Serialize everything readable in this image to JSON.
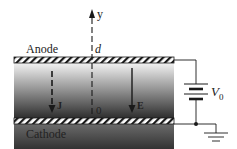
{
  "diagram": {
    "labels": {
      "anode": "Anode",
      "cathode": "Cathode",
      "y_axis": "y",
      "d": "d",
      "origin": "0",
      "current_density": "J",
      "electric_field": "E",
      "voltage_source": "V",
      "voltage_subscript": "0"
    },
    "colors": {
      "region_top": "#f2f2f2",
      "region_bottom": "#2e2e2e",
      "line": "#1a1a1a"
    },
    "components": [
      "anode-plate",
      "cathode-plate",
      "y-axis",
      "current-density-arrow",
      "electric-field-arrow",
      "battery",
      "ground"
    ]
  }
}
